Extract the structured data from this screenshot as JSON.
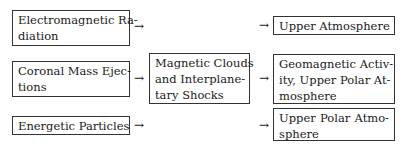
{
  "sources": [
    {
      "lines": [
        "Electromagnetic Ra-",
        "diation"
      ]
    },
    {
      "lines": [
        "Coronal Mass Ejec-",
        "tions"
      ]
    },
    {
      "lines": [
        "Energetic Particles"
      ]
    }
  ],
  "middle": {
    "lines": [
      "Magnetic Clouds",
      "and Interplane-",
      "tary Shocks"
    ]
  },
  "targets": [
    {
      "lines": [
        "Upper Atmosphere"
      ]
    },
    {
      "lines": [
        "Geomagnetic Activ-",
        "ity, Upper Polar At-",
        "mosphere"
      ]
    },
    {
      "lines": [
        "Upper Polar Atmo-",
        "sphere"
      ]
    }
  ],
  "arrow_glyph": "→"
}
